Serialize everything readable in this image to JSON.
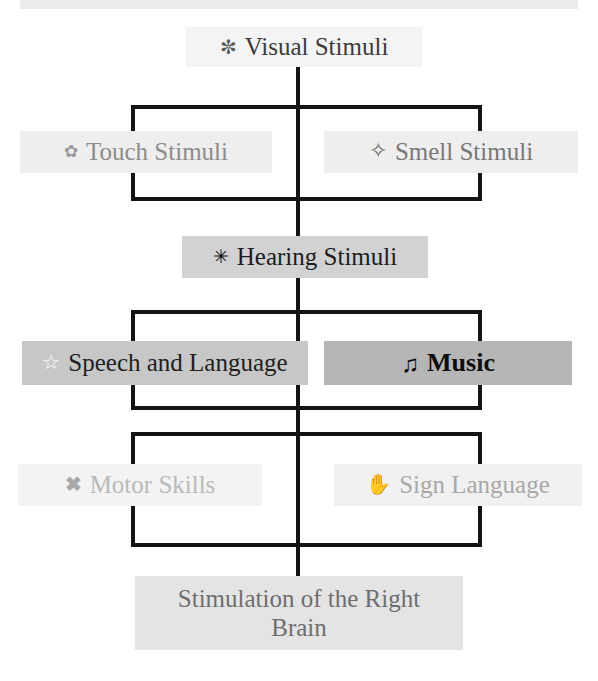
{
  "diagram": {
    "type": "flow-hierarchy",
    "background": "#ffffff",
    "line_color": "#141414",
    "nodes": [
      {
        "id": "visual",
        "label": "Visual Stimuli",
        "icon": "flower-icon",
        "icon_glyph": "✼",
        "box_color": "#f4f4f4",
        "text_color": "#3b3b3b",
        "level": 1
      },
      {
        "id": "touch",
        "label": "Touch Stimuli",
        "icon": "rosette-icon",
        "icon_glyph": "✿",
        "box_color": "#eeeeee",
        "text_color": "#8c8c8c",
        "level": 2
      },
      {
        "id": "smell",
        "label": "Smell Stimuli",
        "icon": "four-pointed-star-icon",
        "icon_glyph": "✧",
        "box_color": "#eeeeee",
        "text_color": "#777777",
        "level": 2
      },
      {
        "id": "hearing",
        "label": "Hearing Stimuli",
        "icon": "eight-pointed-asterisk-icon",
        "icon_glyph": "✳",
        "box_color": "#d2d2d2",
        "text_color": "#1c1c1c",
        "level": 3
      },
      {
        "id": "speech",
        "label": "Speech and Language",
        "icon": "star-outline-icon",
        "icon_glyph": "☆",
        "box_color": "#c7c7c7",
        "text_color": "#1e1e1e",
        "level": 4
      },
      {
        "id": "music",
        "label": "Music",
        "icon": "music-note-icon",
        "icon_glyph": "♫",
        "box_color": "#b6b6b6",
        "text_color": "#0d0d0d",
        "level": 4
      },
      {
        "id": "motor",
        "label": "Motor Skills",
        "icon": "cross-mark-icon",
        "icon_glyph": "✖",
        "box_color": "#f3f3f3",
        "text_color": "#b9b9b9",
        "level": 5
      },
      {
        "id": "sign",
        "label": "Sign Language",
        "icon": "hand-sign-icon",
        "icon_glyph": "✋",
        "box_color": "#f1f1f1",
        "text_color": "#a8a8a8",
        "level": 5
      },
      {
        "id": "target",
        "label": "Stimulation of the Right Brain",
        "icon": null,
        "icon_glyph": "",
        "box_color": "#e4e4e4",
        "text_color": "#6e6e6e",
        "level": 6
      }
    ]
  }
}
